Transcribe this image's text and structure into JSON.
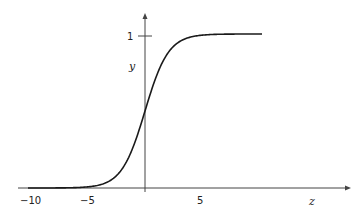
{
  "chart_data": {
    "type": "line",
    "title": "",
    "xlabel": "z",
    "ylabel": "y",
    "function": "sigmoid: y = 1 / (1 + e^(-z))",
    "xlim": [
      -10,
      10
    ],
    "ylim": [
      0,
      1
    ],
    "x_ticks": [
      -10,
      -5,
      5
    ],
    "x_tick_labels": [
      "−10",
      "−5",
      "5"
    ],
    "y_ticks": [
      1
    ],
    "y_tick_labels": [
      "1"
    ],
    "grid": false,
    "legend": null,
    "series": [
      {
        "name": "sigmoid",
        "x": [
          -10,
          -8,
          -6,
          -5,
          -4,
          -3,
          -2,
          -1,
          0,
          1,
          2,
          3,
          4,
          5,
          6,
          8,
          10
        ],
        "values": [
          5e-05,
          0.0003,
          0.0025,
          0.0067,
          0.018,
          0.047,
          0.119,
          0.269,
          0.5,
          0.731,
          0.881,
          0.953,
          0.982,
          0.9933,
          0.9975,
          0.9997,
          0.99995
        ]
      }
    ]
  },
  "labels": {
    "x_axis": "z",
    "y_axis": "y",
    "ytick_1": "1",
    "xtick_m10": "−10",
    "xtick_m5": "−5",
    "xtick_5": "5"
  },
  "colors": {
    "curve": "#1a1a1a",
    "axis": "#333333"
  }
}
